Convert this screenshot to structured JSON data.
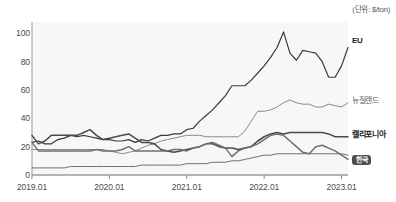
{
  "unit_note": "(단위: $/ton)",
  "axis": {
    "y_ticks": [
      "0",
      "20",
      "40",
      "60",
      "80",
      "100"
    ],
    "x_ticks": [
      "2019.01",
      "2020.01",
      "2021.01",
      "2022.01",
      "2023.01"
    ]
  },
  "labels": {
    "eu": "EU",
    "newzealand": "뉴질랜드",
    "california": "캘리포니아",
    "korea": "한국"
  },
  "colors": {
    "eu": "#3a3a3a",
    "newzealand": "#8a8a8a",
    "california": "#4a4a4a",
    "korea": "#6f6f6f",
    "plot_background": "#f7f7f5",
    "axis": "#9a9a9a",
    "badge": "#4d4d4d"
  },
  "chart_data": {
    "type": "line",
    "title": "",
    "subtitle": "",
    "xlabel": "",
    "ylabel": "",
    "unit": "$/ton",
    "ylim": [
      0,
      108
    ],
    "grid": false,
    "legend_position": "right-inline",
    "x_tick_labels": [
      "2019.01",
      "2020.01",
      "2021.01",
      "2022.01",
      "2023.01"
    ],
    "x_tick_values": [
      0,
      12,
      24,
      36,
      48
    ],
    "x": [
      0,
      1,
      2,
      3,
      4,
      5,
      6,
      7,
      8,
      9,
      10,
      11,
      12,
      13,
      14,
      15,
      16,
      17,
      18,
      19,
      20,
      21,
      22,
      23,
      24,
      25,
      26,
      27,
      28,
      29,
      30,
      31,
      32,
      33,
      34,
      35,
      36,
      37,
      38,
      39,
      40,
      41,
      42,
      43,
      44,
      45,
      46,
      47,
      48,
      49
    ],
    "series": [
      {
        "name": "EU",
        "color": "#3a3a3a",
        "values": [
          23,
          24,
          22,
          22,
          25,
          26,
          28,
          27,
          28,
          27,
          26,
          25,
          25,
          24,
          24,
          25,
          23,
          25,
          24,
          26,
          28,
          28,
          29,
          29,
          32,
          33,
          38,
          42,
          46,
          51,
          56,
          63,
          63,
          63,
          67,
          72,
          77,
          83,
          90,
          101,
          86,
          81,
          88,
          87,
          86,
          80,
          69,
          69,
          77,
          90
        ]
      },
      {
        "name": "뉴질랜드",
        "color": "#8a8a8a",
        "values": [
          18,
          18,
          18,
          18,
          18,
          18,
          18,
          18,
          18,
          18,
          18,
          18,
          17,
          16,
          15,
          16,
          17,
          19,
          21,
          22,
          24,
          25,
          26,
          27,
          28,
          28,
          28,
          27,
          27,
          27,
          27,
          27,
          27,
          31,
          38,
          45,
          45,
          46,
          48,
          51,
          53,
          51,
          50,
          50,
          48,
          48,
          50,
          49,
          48,
          51
        ]
      },
      {
        "name": "캘리포니아",
        "color": "#4a4a4a",
        "values": [
          28,
          22,
          24,
          28,
          28,
          28,
          28,
          28,
          30,
          32,
          28,
          25,
          26,
          27,
          28,
          29,
          26,
          23,
          23,
          22,
          18,
          17,
          16,
          17,
          18,
          19,
          20,
          22,
          22,
          20,
          19,
          19,
          18,
          19,
          20,
          24,
          27,
          29,
          30,
          29,
          30,
          30,
          30,
          30,
          30,
          30,
          29,
          27,
          27,
          27
        ]
      },
      {
        "name": "한국",
        "color": "#6f6f6f",
        "values": [
          23,
          17,
          17,
          17,
          17,
          17,
          17,
          17,
          17,
          17,
          18,
          17,
          17,
          17,
          18,
          20,
          17,
          17,
          17,
          17,
          17,
          17,
          18,
          18,
          17,
          19,
          20,
          22,
          23,
          21,
          19,
          13,
          17,
          19,
          20,
          22,
          25,
          28,
          29,
          28,
          24,
          20,
          16,
          15,
          20,
          21,
          19,
          17,
          14,
          11
        ]
      },
      {
        "name": "한국-floor",
        "color": "#6f6f6f",
        "values": [
          5,
          5,
          5,
          5,
          5,
          5,
          6,
          6,
          6,
          6,
          6,
          6,
          6,
          6,
          6,
          6,
          6,
          7,
          7,
          7,
          7,
          7,
          7,
          7,
          8,
          8,
          8,
          8,
          9,
          9,
          9,
          10,
          10,
          11,
          12,
          13,
          14,
          14,
          15,
          15,
          15,
          15,
          15,
          15,
          15,
          15,
          15,
          15,
          15,
          14
        ]
      }
    ]
  }
}
